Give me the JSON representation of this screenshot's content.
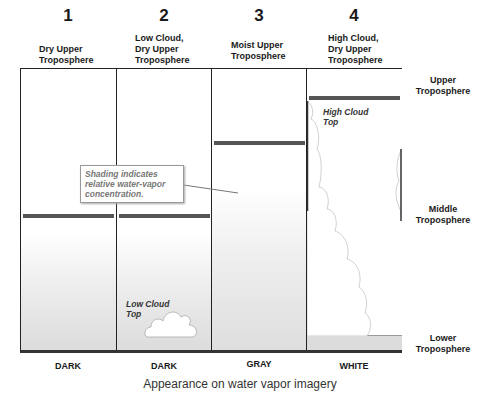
{
  "columns": [
    {
      "number": "1",
      "title_lines": [
        "Dry Upper",
        "Troposphere"
      ],
      "bottom_label": "DARK"
    },
    {
      "number": "2",
      "title_lines": [
        "Low Cloud,",
        "Dry Upper",
        "Troposphere"
      ],
      "bottom_label": "DARK"
    },
    {
      "number": "3",
      "title_lines": [
        "Moist Upper",
        "Troposphere"
      ],
      "bottom_label": "GRAY"
    },
    {
      "number": "4",
      "title_lines": [
        "High Cloud,",
        "Dry Upper",
        "Troposphere"
      ],
      "bottom_label": "WHITE"
    }
  ],
  "layers": {
    "upper": [
      "Upper",
      "Troposphere"
    ],
    "middle": [
      "Middle",
      "Troposphere"
    ],
    "lower": [
      "Lower",
      "Troposphere"
    ]
  },
  "callout": {
    "lines": [
      "Shading indicates",
      "relative water-vapor",
      "concentration."
    ]
  },
  "annotations": {
    "low_cloud": [
      "Low Cloud",
      "Top"
    ],
    "high_cloud": [
      "High Cloud",
      "Top"
    ]
  },
  "caption": "Appearance on water vapor imagery",
  "colors": {
    "bar": "#555555",
    "shade_bottom": "#d9d9d9",
    "border": "#222222"
  }
}
